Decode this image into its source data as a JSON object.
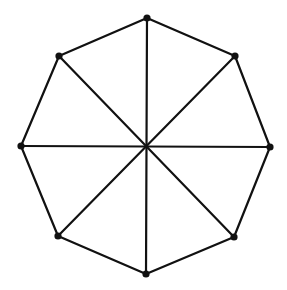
{
  "diagram": {
    "colors": {
      "background": "#ffffff",
      "stroke": "#111111",
      "vertex": "#111111"
    },
    "stroke_width": 2.2,
    "vertex_radius": 3.6,
    "center": {
      "id": "c",
      "x": 147,
      "y": 146
    },
    "vertices": [
      {
        "id": "v0",
        "x": 147,
        "y": 18
      },
      {
        "id": "v1",
        "x": 235,
        "y": 56
      },
      {
        "id": "v2",
        "x": 270,
        "y": 147
      },
      {
        "id": "v3",
        "x": 234,
        "y": 237
      },
      {
        "id": "v4",
        "x": 146,
        "y": 274
      },
      {
        "id": "v5",
        "x": 58,
        "y": 236
      },
      {
        "id": "v6",
        "x": 21,
        "y": 146
      },
      {
        "id": "v7",
        "x": 59,
        "y": 56
      }
    ],
    "rim_edges": [
      [
        0,
        1
      ],
      [
        1,
        2
      ],
      [
        2,
        3
      ],
      [
        3,
        4
      ],
      [
        4,
        5
      ],
      [
        5,
        6
      ],
      [
        6,
        7
      ],
      [
        7,
        0
      ]
    ],
    "spokes": [
      [
        0,
        4
      ],
      [
        1,
        5
      ],
      [
        2,
        6
      ],
      [
        3,
        7
      ]
    ],
    "center_dot": false
  }
}
